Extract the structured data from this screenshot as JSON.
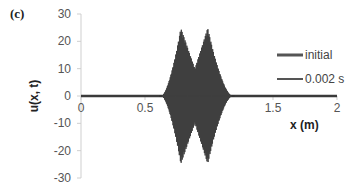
{
  "panel_label": "(c)",
  "chart_data": {
    "type": "line",
    "title": "",
    "xlabel": "x (m)",
    "ylabel": "u(x, t)",
    "xlim": [
      0,
      2
    ],
    "ylim": [
      -30,
      30
    ],
    "x_ticks": [
      "0",
      "0.5",
      "1",
      "1.5",
      "2"
    ],
    "y_ticks": [
      "30",
      "20",
      "10",
      "0",
      "-10",
      "-20",
      "-30"
    ],
    "grid": false,
    "legend_position": "right",
    "series": [
      {
        "name": "initial",
        "color": "#404040",
        "description": "flat zero line across 0-2 m",
        "x": [
          0,
          2
        ],
        "y": [
          0,
          0
        ]
      },
      {
        "name": "0.002 s",
        "color": "#404040",
        "description": "high-frequency oscillating wave packet with two lobes",
        "envelope_start_x": 0.63,
        "envelope_end_x": 1.18,
        "peaks": [
          {
            "x": 0.78,
            "amplitude": 25
          },
          {
            "x": 0.99,
            "amplitude": 25
          }
        ],
        "valley_between_peaks": {
          "x": 0.89,
          "amplitude": 10
        },
        "min_value": -24
      }
    ]
  },
  "legend": {
    "items": [
      {
        "label": "initial"
      },
      {
        "label": "0.002 s"
      }
    ]
  }
}
